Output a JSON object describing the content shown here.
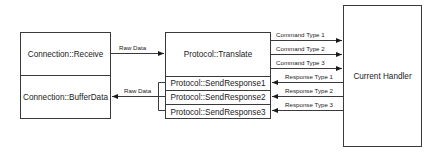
{
  "diagram": {
    "connection_box": {
      "receive": "Connection::Receive",
      "buffer_data": "Connection::BufferData"
    },
    "protocol_box": {
      "translate": "Protocol::Translate",
      "send_responses": [
        "Protocol::SendResponse1",
        "Protocol::SendResponse2",
        "Protocol::SendResponse3"
      ]
    },
    "handler_box": {
      "label": "Current Handler"
    },
    "arrows": {
      "raw_data_in": "Raw Data",
      "raw_data_out": "Raw Data",
      "commands": [
        "Command Type 1",
        "Command Type 2",
        "Command Type 3"
      ],
      "responses": [
        "Response Type 1",
        "Response Type 2",
        "Response Type 3"
      ]
    },
    "colors": {
      "line": "#3a3a3a",
      "background": "#ffffff"
    }
  }
}
